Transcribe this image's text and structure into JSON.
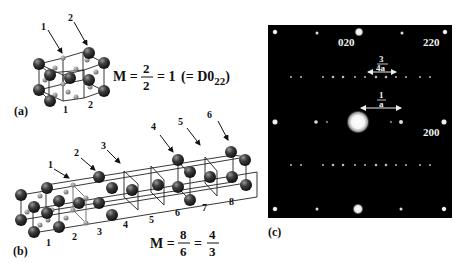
{
  "figure": {
    "panel_a": {
      "label": "(a)",
      "arrow_labels": [
        "1",
        "2"
      ],
      "bottom_labels": [
        "1",
        "2"
      ],
      "equation": {
        "lhs": "M =",
        "numerator": "2",
        "denominator": "2",
        "result": "= 1",
        "note": "(= D0",
        "note_sub": "22",
        "note_close": ")"
      }
    },
    "panel_b": {
      "label": "(b)",
      "arrow_labels": [
        "1",
        "2",
        "3",
        "4",
        "5",
        "6"
      ],
      "bottom_labels": [
        "1",
        "2",
        "3",
        "4",
        "5",
        "6",
        "7",
        "8"
      ],
      "equation": {
        "lhs": "M =",
        "numerator1": "8",
        "denominator1": "6",
        "eq": "=",
        "numerator2": "4",
        "denominator2": "3"
      }
    },
    "panel_c": {
      "label": "(c)",
      "spot_labels": {
        "top_center": "020",
        "top_right": "220",
        "right_center": "200"
      },
      "annotation_upper": {
        "numerator": "3",
        "denominator": "4a"
      },
      "annotation_lower": {
        "numerator": "1",
        "denominator": "a"
      },
      "colors": {
        "background": "#000000",
        "spots": "#ffffff"
      }
    }
  }
}
